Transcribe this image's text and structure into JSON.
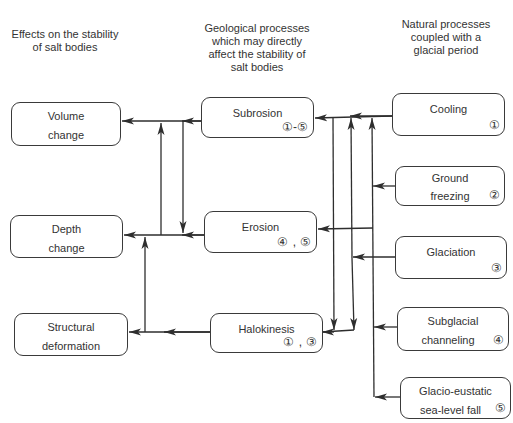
{
  "headers": {
    "left": [
      "Effects on the stability",
      "of salt bodies"
    ],
    "middle": [
      "Geological processes",
      "which may directly",
      "affect the stability of",
      "salt bodies"
    ],
    "right": [
      "Natural processes",
      "coupled with a",
      "glacial period"
    ]
  },
  "effects": [
    {
      "id": "volume",
      "lines": [
        "Volume",
        "change"
      ]
    },
    {
      "id": "depth",
      "lines": [
        "Depth",
        "change"
      ]
    },
    {
      "id": "structural",
      "lines": [
        "Structural",
        "deformation"
      ]
    }
  ],
  "geological": [
    {
      "id": "subrosion",
      "lines": [
        "Subrosion"
      ],
      "badge": "①-⑤"
    },
    {
      "id": "erosion",
      "lines": [
        "Erosion"
      ],
      "badge": "④ , ⑤"
    },
    {
      "id": "halokinesis",
      "lines": [
        "Halokinesis"
      ],
      "badge": "① , ③"
    }
  ],
  "natural": [
    {
      "id": "cooling",
      "number": 1,
      "lines": [
        "Cooling",
        ""
      ],
      "badge": "①"
    },
    {
      "id": "ground-freezing",
      "number": 2,
      "lines": [
        "Ground",
        "freezing"
      ],
      "badge": "②"
    },
    {
      "id": "glaciation",
      "number": 3,
      "lines": [
        "Glaciation",
        ""
      ],
      "badge": "③"
    },
    {
      "id": "subglacial-channeling",
      "number": 4,
      "lines": [
        "Subglacial",
        "channeling"
      ],
      "badge": "④"
    },
    {
      "id": "glacio-eustatic",
      "number": 5,
      "lines": [
        "Glacio-eustatic",
        "sea-level fall"
      ],
      "badge": "⑤"
    }
  ],
  "connections": [
    {
      "from": "subrosion",
      "to": "volume"
    },
    {
      "from": "subrosion",
      "to": "depth"
    },
    {
      "from": "erosion",
      "to": "depth"
    },
    {
      "from": "erosion",
      "to": "volume"
    },
    {
      "from": "halokinesis",
      "to": "structural"
    },
    {
      "from": "structural",
      "to": "depth"
    },
    {
      "from": "cooling",
      "to": "subrosion"
    },
    {
      "from": "ground-freezing",
      "to": "subrosion"
    },
    {
      "from": "glaciation",
      "to": "subrosion"
    },
    {
      "from": "subglacial-channeling",
      "to": "subrosion"
    },
    {
      "from": "glacio-eustatic",
      "to": "subrosion"
    },
    {
      "from": "cooling",
      "to": "erosion"
    },
    {
      "from": "cooling",
      "to": "halokinesis"
    },
    {
      "from": "glaciation",
      "to": "halokinesis"
    }
  ],
  "colors": {
    "line": "#2e2e2e",
    "border": "#3a3a3a",
    "text": "#333333",
    "background": "#ffffff"
  }
}
